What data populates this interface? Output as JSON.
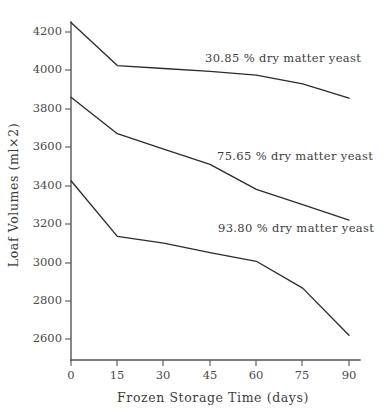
{
  "chart_data": {
    "type": "line",
    "title": "",
    "xlabel": "Frozen Storage Time (days)",
    "ylabel": "Loaf Volumes (ml×2)",
    "x": [
      0,
      15,
      30,
      45,
      60,
      75,
      90
    ],
    "xticklabels": [
      "0",
      "15",
      "30",
      "45",
      "60",
      "75",
      "90"
    ],
    "yticks": [
      2600,
      2800,
      3000,
      3200,
      3400,
      3600,
      3800,
      4200,
      4000
    ],
    "yticklabels": [
      "2600",
      "2800",
      "3000",
      "3200",
      "3400",
      "3600",
      "3800",
      "4000",
      "4200"
    ],
    "xlim": [
      0,
      90
    ],
    "ylim": [
      2450,
      4300
    ],
    "grid": false,
    "legend_position": "inline-annotations",
    "series": [
      {
        "name": "30.85 % dry matter yeast",
        "label": "30.85 % dry matter yeast",
        "values": [
          4250,
          4025,
          4010,
          3995,
          3975,
          3930,
          3855
        ],
        "color": "#2c2c2c"
      },
      {
        "name": "75.65 % dry matter yeast",
        "label": "75.65 % dry matter yeast",
        "values": [
          3860,
          3670,
          3590,
          3510,
          3380,
          3300,
          3220
        ],
        "color": "#2c2c2c"
      },
      {
        "name": "93.80 % dry matter yeast",
        "label": "93.80 % dry matter yeast",
        "values": [
          3425,
          3135,
          3100,
          3050,
          3005,
          2865,
          2620
        ],
        "color": "#2c2c2c"
      }
    ],
    "annotations": [
      {
        "text": "30.85 % dry matter yeast",
        "x_px": 205,
        "y_px": 62
      },
      {
        "text": "75.65 % dry matter yeast",
        "x_px": 217,
        "y_px": 160
      },
      {
        "text": "93.80 % dry matter yeast",
        "x_px": 218,
        "y_px": 232
      }
    ]
  },
  "axes": {
    "x_title": "Frozen Storage Time (days)",
    "y_title": "Loaf Volumes (ml×2)"
  },
  "colors": {
    "line": "#2c2c2c",
    "axis": "#555555",
    "text": "#3d3d3d",
    "background": "#ffffff"
  }
}
